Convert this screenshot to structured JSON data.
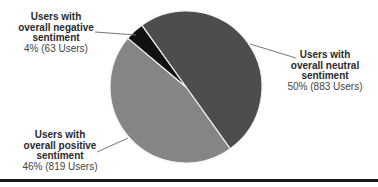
{
  "chart_data": {
    "type": "pie",
    "title": "",
    "slices": [
      {
        "label": "Users with overall neutral sentiment",
        "percent": 50,
        "users": 883,
        "color": "#4d4d4d",
        "display_value": "50% (883 Users)"
      },
      {
        "label": "Users with overall positive sentiment",
        "percent": 46,
        "users": 819,
        "color": "#858585",
        "display_value": "46% (819 Users)"
      },
      {
        "label": "Users with overall negative sentiment",
        "percent": 4,
        "users": 63,
        "color": "#111111",
        "display_value": "4% (63 Users)"
      }
    ],
    "legend": "none (leader-line labels)"
  },
  "labels": {
    "negative": {
      "line1": "Users with",
      "line2": "overall negative",
      "line3": "sentiment",
      "value": "4% (63 Users)"
    },
    "neutral": {
      "line1": "Users with",
      "line2": "overall neutral",
      "line3": "sentiment",
      "value": "50% (883 Users)"
    },
    "positive": {
      "line1": "Users with",
      "line2": "overall positive",
      "line3": "sentiment",
      "value": "46% (819 Users)"
    }
  }
}
